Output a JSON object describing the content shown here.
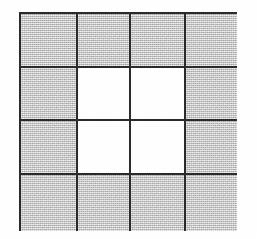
{
  "figure": {
    "background_color": "#ffffff",
    "line_color": "#2b2b2b",
    "shaded_color": "#c9c9c9",
    "blank_color": "#ffffff",
    "line_width_px": 2,
    "bounds": {
      "x": 19,
      "y": 12,
      "width": 218,
      "height": 219
    },
    "grid": {
      "rows": 4,
      "columns": 4,
      "vertical_line_x": [
        19,
        76,
        129,
        184,
        237
      ],
      "horizontal_line_y": [
        12,
        66,
        119,
        173,
        231
      ],
      "cell_counts": {
        "shaded": 12,
        "blank": 4,
        "total": 16
      },
      "cells": [
        [
          {
            "id": "r1c1",
            "state": "shaded"
          },
          {
            "id": "r1c2",
            "state": "shaded"
          },
          {
            "id": "r1c3",
            "state": "shaded"
          },
          {
            "id": "r1c4",
            "state": "shaded"
          }
        ],
        [
          {
            "id": "r2c1",
            "state": "shaded"
          },
          {
            "id": "r2c2",
            "state": "blank"
          },
          {
            "id": "r2c3",
            "state": "blank"
          },
          {
            "id": "r2c4",
            "state": "shaded"
          }
        ],
        [
          {
            "id": "r3c1",
            "state": "shaded"
          },
          {
            "id": "r3c2",
            "state": "blank"
          },
          {
            "id": "r3c3",
            "state": "blank"
          },
          {
            "id": "r3c4",
            "state": "shaded"
          }
        ],
        [
          {
            "id": "r4c1",
            "state": "shaded"
          },
          {
            "id": "r4c2",
            "state": "shaded"
          },
          {
            "id": "r4c3",
            "state": "shaded"
          },
          {
            "id": "r4c4",
            "state": "shaded"
          }
        ]
      ]
    }
  }
}
